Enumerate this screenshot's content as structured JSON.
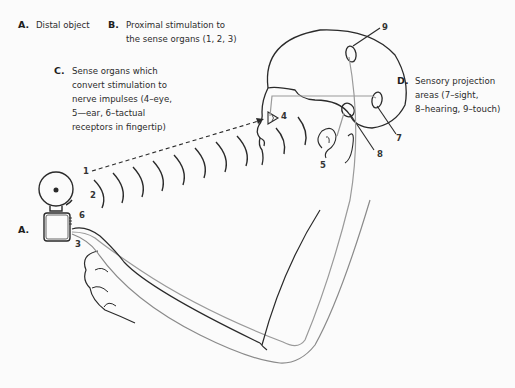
{
  "labels": {
    "A": {
      "key": "A.",
      "text": "Distal object"
    },
    "B": {
      "key": "B.",
      "text": "Proximal stimulation to\nthe sense organs (1, 2, 3)"
    },
    "C": {
      "key": "C.",
      "text": "Sense organs which\nconvert stimulation to\nnerve impulses (4–eye,\n5—ear, 6–tactual\nreceptors in fingertip)"
    },
    "D": {
      "key": "D.",
      "text": "Sensory projection\nareas (7–sight,\n8–hearing, 9–touch)"
    }
  },
  "object_marker": "A.",
  "numbers": {
    "n1": "1",
    "n2": "2",
    "n3": "3",
    "n4": "4",
    "n5": "5",
    "n6": "6",
    "n7": "7",
    "n8": "8",
    "n9": "9"
  },
  "colors": {
    "ink": "#2a2a2a",
    "nerve_line": "#9a9a9a",
    "background": "#fbfbfb"
  }
}
